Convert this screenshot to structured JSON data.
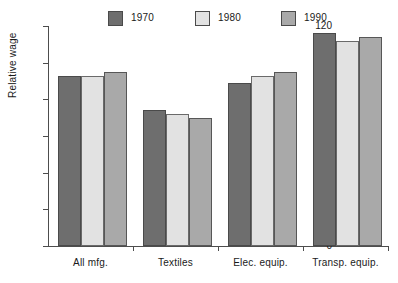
{
  "chart_data": {
    "type": "bar",
    "title": "",
    "subtitle": "",
    "xlabel": "",
    "ylabel": "Relative wage",
    "ylim": [
      0,
      120
    ],
    "yticks": [
      0,
      20,
      40,
      60,
      80,
      100,
      120
    ],
    "grid": false,
    "legend_position": "top",
    "categories": [
      "All mfg.",
      "Textiles",
      "Elec. equip.",
      "Transp. equip."
    ],
    "series": [
      {
        "name": "1970",
        "color": "#6e6e6e",
        "values": [
          93,
          74,
          89,
          116
        ]
      },
      {
        "name": "1980",
        "color": "#e2e2e2",
        "values": [
          93,
          72,
          93,
          112
        ]
      },
      {
        "name": "1990",
        "color": "#a9a9a9",
        "values": [
          95,
          70,
          95,
          114
        ]
      }
    ]
  },
  "legend": {
    "items": [
      {
        "label": "1970"
      },
      {
        "label": "1980"
      },
      {
        "label": "1990"
      }
    ]
  },
  "axes": {
    "y_title": "Relative wage",
    "y_tick_labels": [
      "120",
      "100",
      "80",
      "60",
      "40",
      "20",
      "0"
    ],
    "x_tick_labels": [
      "All mfg.",
      "Textiles",
      "Elec. equip.",
      "Transp. equip."
    ]
  }
}
